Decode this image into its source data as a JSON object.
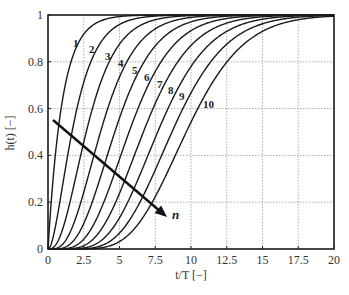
{
  "chart_data": {
    "type": "line",
    "title": "",
    "xlabel": "t/T [−]",
    "ylabel": "h(t) [−]",
    "xlim": [
      0,
      20
    ],
    "ylim": [
      0,
      1
    ],
    "xticks": [
      0,
      2.5,
      5,
      7.5,
      10,
      12.5,
      15,
      17.5,
      20
    ],
    "xtick_labels": [
      "0",
      "2.5",
      "5",
      "7.5",
      "10",
      "12.5",
      "15",
      "17.5",
      "20"
    ],
    "yticks": [
      0,
      0.2,
      0.4,
      0.6,
      0.8,
      1
    ],
    "ytick_labels": [
      "0",
      "0.2",
      "0.4",
      "0.6",
      "0.8",
      "1"
    ],
    "grid": true,
    "legend": "none (curves labelled inline 1–10)",
    "model": "Erlang step response h(t) = 1 − e^(−t/T) Σ_{k=0}^{n−1} (t/T)^k / k!",
    "series": [
      {
        "name": "1",
        "n": 1
      },
      {
        "name": "2",
        "n": 2
      },
      {
        "name": "3",
        "n": 3
      },
      {
        "name": "4",
        "n": 4
      },
      {
        "name": "5",
        "n": 5
      },
      {
        "name": "6",
        "n": 6
      },
      {
        "name": "7",
        "n": 7
      },
      {
        "name": "8",
        "n": 8
      },
      {
        "name": "9",
        "n": 9
      },
      {
        "name": "10",
        "n": 10
      }
    ],
    "sample_points": {
      "x": [
        0,
        2.5,
        5,
        7.5,
        10,
        12.5,
        15,
        17.5,
        20
      ],
      "n1": [
        0,
        0.92,
        0.99,
        1.0,
        1.0,
        1.0,
        1.0,
        1.0,
        1.0
      ],
      "n5": [
        0,
        0.11,
        0.56,
        0.87,
        0.97,
        0.99,
        1.0,
        1.0,
        1.0
      ],
      "n10": [
        0,
        0.0,
        0.03,
        0.22,
        0.54,
        0.8,
        0.93,
        0.98,
        0.99
      ]
    },
    "annotations": [
      {
        "text": "n",
        "type": "arrow",
        "from": [
          0.5,
          0.55
        ],
        "to": [
          8.5,
          0.13
        ],
        "meaning": "increasing n"
      }
    ],
    "curve_label_positions": [
      {
        "label": "1",
        "px": [
          73,
          47
        ]
      },
      {
        "label": "2",
        "px": [
          89,
          53
        ]
      },
      {
        "label": "3",
        "px": [
          105,
          60
        ]
      },
      {
        "label": "4",
        "px": [
          118,
          67
        ]
      },
      {
        "label": "5",
        "px": [
          132,
          74
        ]
      },
      {
        "label": "6",
        "px": [
          144,
          81
        ]
      },
      {
        "label": "7",
        "px": [
          157,
          88
        ]
      },
      {
        "label": "8",
        "px": [
          168,
          94
        ]
      },
      {
        "label": "9",
        "px": [
          179,
          100
        ]
      },
      {
        "label": "10",
        "px": [
          203,
          108
        ]
      }
    ]
  }
}
